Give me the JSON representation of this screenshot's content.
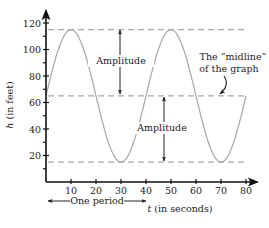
{
  "chart_data": {
    "type": "line",
    "title": "",
    "xlabel": "t (in seconds)",
    "xlabel_var": "t",
    "xlabel_unit": "(in seconds)",
    "ylabel": "h (in feet)",
    "ylabel_var": "h",
    "ylabel_unit": "(in feet)",
    "xlim": [
      0,
      85
    ],
    "ylim": [
      0,
      125
    ],
    "x_ticks": [
      10,
      20,
      30,
      40,
      50,
      60,
      70,
      80
    ],
    "x_tick_labels": [
      "10",
      "20",
      "30",
      "40",
      "50",
      "60",
      "70",
      "80"
    ],
    "y_ticks": [
      20,
      40,
      60,
      80,
      100,
      120
    ],
    "y_tick_labels": [
      "20",
      "40",
      "60",
      "80",
      "100",
      "120"
    ],
    "y_minor_ticks": [
      10,
      30,
      50,
      70,
      90,
      110
    ],
    "grid": false,
    "series": [
      {
        "name": "h(t)",
        "function": "h = 65 + 50*sin(2*pi*t/40)",
        "color": "#a8a8a8",
        "x": [
          0,
          5,
          10,
          15,
          20,
          25,
          30,
          35,
          40,
          45,
          50,
          55,
          60,
          65,
          70,
          75,
          80
        ],
        "values": [
          65,
          100.4,
          115,
          100.4,
          65,
          29.6,
          15,
          29.6,
          65,
          100.4,
          115,
          100.4,
          65,
          29.6,
          15,
          29.6,
          65
        ]
      }
    ],
    "reference_lines": [
      {
        "name": "maximum",
        "y": 115,
        "style": "dashed",
        "color": "#a8a8a8"
      },
      {
        "name": "midline",
        "y": 65,
        "style": "dashed",
        "color": "#a8a8a8"
      },
      {
        "name": "minimum",
        "y": 15,
        "style": "dashed",
        "color": "#a8a8a8"
      }
    ],
    "annotations": [
      {
        "text": "Amplitude",
        "type": "double-arrow",
        "x": 22,
        "y_from": 115,
        "y_to": 65
      },
      {
        "text": "Amplitude",
        "type": "double-arrow",
        "x": 48,
        "y_from": 65,
        "y_to": 15
      },
      {
        "text": "The “midline” of the graph",
        "line1": "The “midline”",
        "line2": "of the graph",
        "type": "curved-arrow",
        "points_to": {
          "x": 68,
          "y": 65
        }
      },
      {
        "text": "One period",
        "type": "double-arrow-horizontal",
        "x_from": 0,
        "x_to": 40,
        "y_below_axis": true
      }
    ]
  },
  "labels": {
    "amplitude_top": "Amplitude",
    "amplitude_bottom": "Amplitude",
    "midline_line1": "The “midline”",
    "midline_line2": "of the graph",
    "one_period": "One period",
    "x_axis_var": "t",
    "x_axis_unit": " (in seconds)",
    "y_axis_var": "h",
    "y_axis_unit": " (in feet)"
  },
  "colors": {
    "axis": "#111111",
    "curve": "#a8a8a8",
    "dashed": "#a8a8a8",
    "arrow": "#222222"
  }
}
